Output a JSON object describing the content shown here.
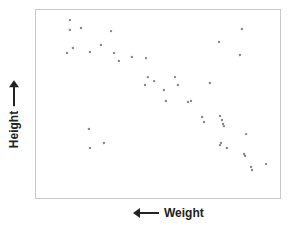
{
  "chart_data": {
    "type": "scatter",
    "title": "",
    "xlabel": "Weight",
    "ylabel": "Height",
    "xlabel_arrow": "left",
    "ylabel_arrow": "up",
    "xlim": [
      0,
      100
    ],
    "ylim": [
      0,
      100
    ],
    "grid": false,
    "legend": null,
    "tick_labels": false,
    "point_color": "#888888",
    "frame_color": "#c8c8c8",
    "series": [
      {
        "name": "points",
        "points": [
          [
            13.8,
            94.7
          ],
          [
            13.8,
            89.5
          ],
          [
            18.3,
            90.5
          ],
          [
            30.5,
            88.9
          ],
          [
            12.6,
            77.4
          ],
          [
            15.0,
            80.0
          ],
          [
            21.9,
            77.9
          ],
          [
            26.4,
            81.6
          ],
          [
            31.7,
            77.4
          ],
          [
            33.7,
            73.2
          ],
          [
            39.0,
            75.3
          ],
          [
            44.7,
            74.7
          ],
          [
            45.5,
            64.7
          ],
          [
            44.3,
            60.5
          ],
          [
            48.0,
            62.6
          ],
          [
            56.5,
            64.7
          ],
          [
            57.7,
            60.5
          ],
          [
            52.0,
            57.9
          ],
          [
            52.8,
            52.1
          ],
          [
            61.8,
            51.6
          ],
          [
            63.0,
            52.1
          ],
          [
            83.7,
            90.0
          ],
          [
            74.4,
            83.2
          ],
          [
            82.9,
            76.3
          ],
          [
            70.7,
            61.6
          ],
          [
            67.5,
            43.7
          ],
          [
            68.3,
            41.1
          ],
          [
            74.8,
            44.2
          ],
          [
            75.6,
            42.1
          ],
          [
            76.0,
            40.0
          ],
          [
            76.4,
            38.9
          ],
          [
            85.4,
            34.7
          ],
          [
            74.8,
            28.9
          ],
          [
            75.2,
            30.0
          ],
          [
            77.6,
            27.4
          ],
          [
            84.6,
            24.2
          ],
          [
            85.0,
            23.2
          ],
          [
            87.4,
            17.4
          ],
          [
            87.8,
            15.8
          ],
          [
            93.5,
            18.9
          ],
          [
            21.5,
            37.4
          ],
          [
            27.6,
            30.0
          ],
          [
            21.9,
            27.4
          ]
        ]
      }
    ]
  }
}
